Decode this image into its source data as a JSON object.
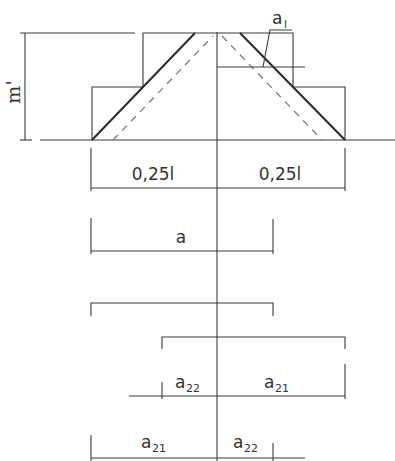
{
  "diagram": {
    "labels": {
      "m_prime": "m'",
      "a1_base": "a",
      "a1_sub": "l",
      "quarter_left": "0,25l",
      "quarter_right": "0,25l",
      "a": "a",
      "a22_top_base": "a",
      "a22_top_sub": "22",
      "a21_top_base": "a",
      "a21_top_sub": "21",
      "a21_bottom_base": "a",
      "a21_bottom_sub": "21",
      "a22_bottom_base": "a",
      "a22_bottom_sub": "22"
    },
    "colors": {
      "line": "#3a3a3a",
      "dashed": "#7a7a7a",
      "background": "#ffffff"
    }
  }
}
